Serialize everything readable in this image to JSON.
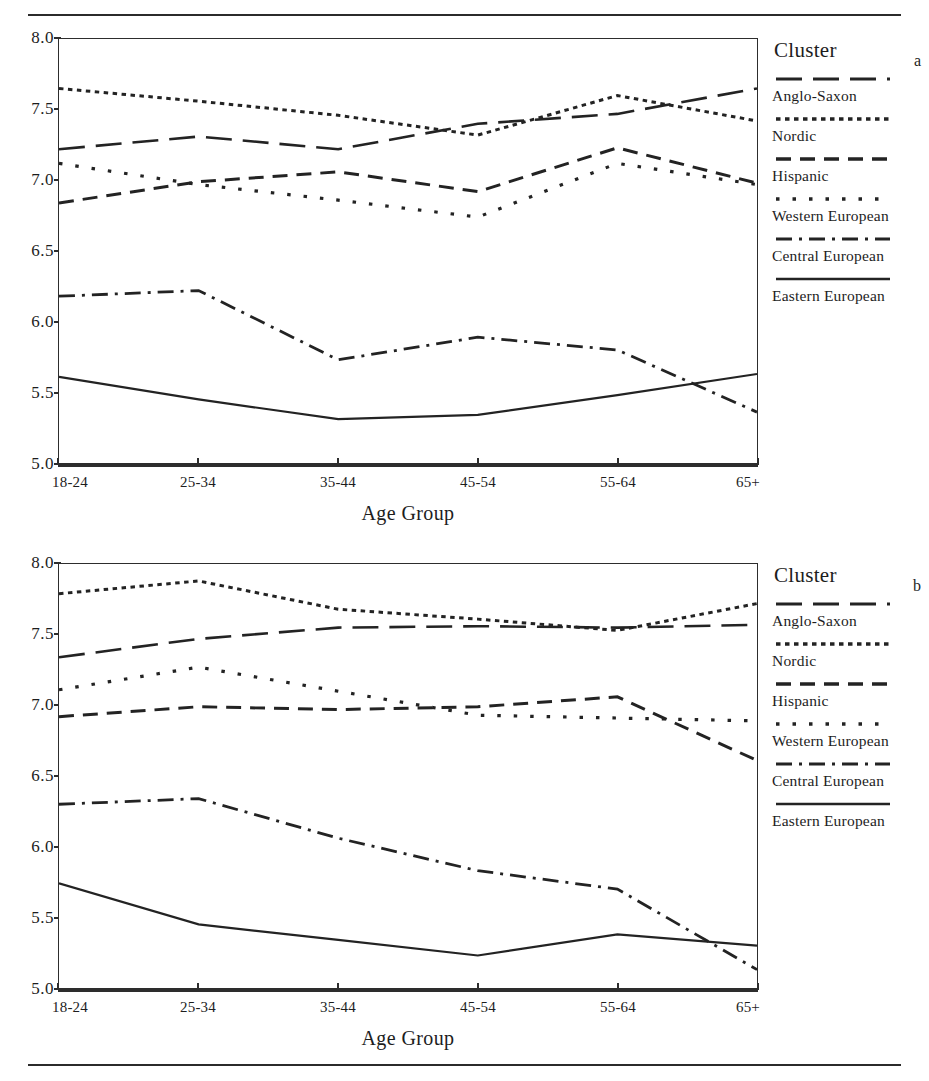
{
  "header": {
    "title": ""
  },
  "axis": {
    "y_ticks": [
      "8.0",
      "7.5",
      "7.0",
      "6.5",
      "6.0",
      "5.5",
      "5.0"
    ],
    "x_ticks": [
      "18-24",
      "25-34",
      "35-44",
      "45-54",
      "55-64",
      "65+"
    ],
    "x_title": "Age Group",
    "y_min": 5.0,
    "y_max": 8.0
  },
  "legend": {
    "title": "Cluster",
    "items": [
      {
        "label": "Anglo-Saxon",
        "style": "long-dash"
      },
      {
        "label": "Nordic",
        "style": "fine-dot"
      },
      {
        "label": "Hispanic",
        "style": "dash"
      },
      {
        "label": "Western European",
        "style": "sparse-dot"
      },
      {
        "label": "Central European",
        "style": "dash-dot"
      },
      {
        "label": "Eastern European",
        "style": "solid"
      }
    ]
  },
  "panels": [
    {
      "letter": "a"
    },
    {
      "letter": "b"
    }
  ],
  "chart_data": [
    {
      "type": "line",
      "panel": "a",
      "title": "",
      "xlabel": "Age Group",
      "ylabel": "",
      "categories": [
        "18-24",
        "25-34",
        "35-44",
        "45-54",
        "55-64",
        "65+"
      ],
      "ylim": [
        5.0,
        8.0
      ],
      "grid": false,
      "legend_position": "right",
      "series": [
        {
          "name": "Anglo-Saxon",
          "style": "long-dash",
          "values": [
            7.22,
            7.31,
            7.22,
            7.4,
            7.47,
            7.65
          ]
        },
        {
          "name": "Nordic",
          "style": "fine-dot",
          "values": [
            7.65,
            7.56,
            7.46,
            7.32,
            7.6,
            7.42
          ]
        },
        {
          "name": "Hispanic",
          "style": "dash",
          "values": [
            6.84,
            6.99,
            7.06,
            6.92,
            7.23,
            6.98
          ]
        },
        {
          "name": "Western European",
          "style": "sparse-dot",
          "values": [
            7.12,
            6.97,
            6.86,
            6.74,
            7.12,
            6.97
          ]
        },
        {
          "name": "Central European",
          "style": "dash-dot",
          "values": [
            6.18,
            6.22,
            5.73,
            5.89,
            5.8,
            5.36
          ]
        },
        {
          "name": "Eastern European",
          "style": "solid",
          "values": [
            5.61,
            5.45,
            5.31,
            5.34,
            5.48,
            5.63
          ]
        }
      ]
    },
    {
      "type": "line",
      "panel": "b",
      "title": "",
      "xlabel": "Age Group",
      "ylabel": "",
      "categories": [
        "18-24",
        "25-34",
        "35-44",
        "45-54",
        "55-64",
        "65+"
      ],
      "ylim": [
        5.0,
        8.0
      ],
      "grid": false,
      "legend_position": "right",
      "series": [
        {
          "name": "Anglo-Saxon",
          "style": "long-dash",
          "values": [
            7.34,
            7.47,
            7.55,
            7.56,
            7.55,
            7.57
          ]
        },
        {
          "name": "Nordic",
          "style": "fine-dot",
          "values": [
            7.79,
            7.88,
            7.68,
            7.61,
            7.53,
            7.72
          ]
        },
        {
          "name": "Hispanic",
          "style": "dash",
          "values": [
            6.92,
            6.99,
            6.97,
            6.99,
            7.06,
            6.61
          ]
        },
        {
          "name": "Western European",
          "style": "sparse-dot",
          "values": [
            7.11,
            7.27,
            7.1,
            6.93,
            6.91,
            6.89
          ]
        },
        {
          "name": "Central European",
          "style": "dash-dot",
          "values": [
            6.3,
            6.34,
            6.06,
            5.83,
            5.7,
            5.13
          ]
        },
        {
          "name": "Eastern European",
          "style": "solid",
          "values": [
            5.74,
            5.45,
            5.34,
            5.23,
            5.38,
            5.3
          ]
        }
      ]
    }
  ]
}
